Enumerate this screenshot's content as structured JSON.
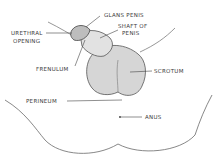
{
  "diagram": {
    "type": "anatomical-sketch",
    "labels": {
      "glans_penis": "GLANS PENIS",
      "shaft_line1": "SHAFT OF",
      "shaft_line2": "PENIS",
      "urethral_line1": "URETHRAL",
      "urethral_line2": "OPENING",
      "frenulum": "FRENULUM",
      "scrotum": "SCROTUM",
      "perineum": "PERINEUM",
      "anus": "ANUS"
    },
    "colors": {
      "outline": "#4a4a4a",
      "shading": "#cfcfcf",
      "label_text": "#3a3a3a"
    }
  }
}
